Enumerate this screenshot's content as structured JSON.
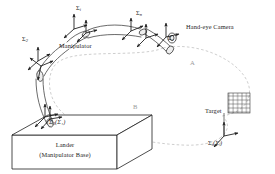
{
  "figure": {
    "kind": "technical-line-diagram",
    "background_color": "#ffffff",
    "line_color": "#1f1f1f",
    "dashed_color": "#b9b9b9"
  },
  "labels": {
    "manipulator": "Manipulator",
    "hand_eye_camera": "Hand-eye Camera",
    "target": "Target",
    "lander_line1": "Lander",
    "lander_line2": "(Manipulator Base)",
    "path_a": "A",
    "path_b": "B"
  },
  "frames": [
    {
      "id": "frame-i",
      "sigma": "Σ",
      "sub": "i",
      "paren": "",
      "x": 76,
      "y": 5,
      "name": "link-i-frame"
    },
    {
      "id": "frame-n",
      "sigma": "Σ",
      "sub": "n",
      "paren": "",
      "x": 136,
      "y": 10,
      "name": "link-n-frame"
    },
    {
      "id": "frame-c",
      "sigma": "Σ",
      "sub": "c",
      "paren": "",
      "x": 168,
      "y": 35,
      "name": "camera-frame"
    },
    {
      "id": "frame-2",
      "sigma": "Σ",
      "sub": "2",
      "paren": "",
      "x": 22,
      "y": 36,
      "name": "link-2-frame"
    },
    {
      "id": "frame-0",
      "sigma": "Σ",
      "sub": "0",
      "paren": "(Σ₁)",
      "x": 49,
      "y": 119,
      "name": "base-frame"
    },
    {
      "id": "frame-t",
      "sigma": "Σ",
      "sub": "t",
      "paren": "(Σⱼ)",
      "x": 208,
      "y": 140,
      "name": "target-frame"
    }
  ],
  "target_grid": {
    "cols": 5,
    "rows": 5,
    "x": 228,
    "y": 93,
    "w": 22,
    "h": 20
  }
}
